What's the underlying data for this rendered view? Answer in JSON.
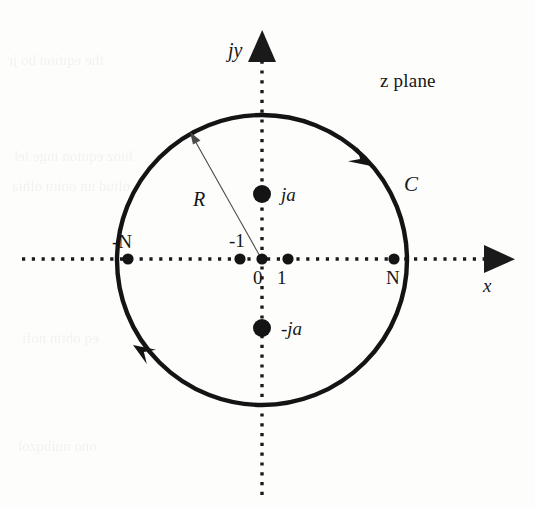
{
  "figure": {
    "caption_text": "z plane",
    "background_color": "#fdfdfc",
    "ink_color": "#161616",
    "axes": {
      "vertical": {
        "label": "jy",
        "style": "dotted",
        "arrow": "up",
        "origin_px": [
          262,
          259
        ],
        "tip_px": [
          262,
          31
        ],
        "tail_px": [
          262,
          495
        ]
      },
      "horizontal": {
        "label": "x",
        "style": "dotted",
        "arrow": "right",
        "origin_px": [
          262,
          259
        ],
        "tip_px": [
          512,
          259
        ],
        "tail_px": [
          22,
          259
        ]
      }
    },
    "contour": {
      "name": "C",
      "label": "C",
      "shape": "circle",
      "center_px": [
        262,
        260
      ],
      "radius_px": 145,
      "direction": "counterclockwise",
      "arrowheads": [
        {
          "position_deg": 52,
          "name": "contour-arrow-upper-right"
        },
        {
          "position_deg": 208,
          "name": "contour-arrow-lower-left"
        }
      ]
    },
    "radius_marker": {
      "label": "R",
      "from_px": [
        262,
        259
      ],
      "to_px": [
        192,
        135
      ],
      "arrow": "outward"
    },
    "points": [
      {
        "id": "pole-ja",
        "label": "ja",
        "label_style": "italic",
        "axis": "imaginary",
        "value": "ja",
        "px": [
          262,
          194
        ],
        "radius_px": 9,
        "label_px": [
          281,
          185
        ]
      },
      {
        "id": "pole-minus-ja",
        "label": "-ja",
        "label_style": "italic",
        "axis": "imaginary",
        "value": "-ja",
        "px": [
          262,
          328
        ],
        "radius_px": 9,
        "label_px": [
          281,
          319
        ]
      },
      {
        "id": "point-minus-N",
        "label": "-N",
        "label_style": "upright",
        "axis": "real",
        "value": "-N",
        "px": [
          128,
          259
        ],
        "radius_px": 5.5,
        "label_px": [
          112,
          232
        ]
      },
      {
        "id": "point-minus-1",
        "label": "-1",
        "label_style": "upright",
        "axis": "real",
        "value": "-1",
        "px": [
          240,
          259
        ],
        "radius_px": 5.5,
        "label_px": [
          229,
          231
        ]
      },
      {
        "id": "point-zero",
        "label": "0",
        "label_style": "upright",
        "axis": "real",
        "value": "0",
        "px": [
          262,
          259
        ],
        "radius_px": 5.5,
        "label_px": [
          253,
          268
        ]
      },
      {
        "id": "point-one",
        "label": "1",
        "label_style": "upright",
        "axis": "real",
        "value": "1",
        "px": [
          288,
          259
        ],
        "radius_px": 5.5,
        "label_px": [
          277,
          268
        ]
      },
      {
        "id": "point-N",
        "label": "N",
        "label_style": "upright",
        "axis": "real",
        "value": "N",
        "px": [
          394,
          259
        ],
        "radius_px": 5.5,
        "label_px": [
          386,
          268
        ]
      }
    ]
  },
  "background_bleed": [
    {
      "text": "the  eqition  bo    jr",
      "x": 8,
      "y": 52,
      "size": 15
    },
    {
      "text": "hioz equion inge iel",
      "x": 14,
      "y": 148,
      "size": 15
    },
    {
      "text": "oliud un onitu olhia",
      "x": 12,
      "y": 178,
      "size": 15
    },
    {
      "text": "eq  obtin  nofi",
      "x": 22,
      "y": 330,
      "size": 15
    },
    {
      "text": "ono  nuibqzol",
      "x": 18,
      "y": 438,
      "size": 15
    }
  ]
}
